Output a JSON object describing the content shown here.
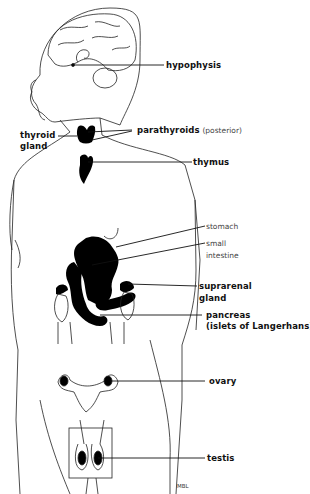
{
  "diagram": {
    "signature": "MBL",
    "labels": {
      "hypophysis": "hypophysis",
      "thyroid_line1": "thyroid",
      "thyroid_line2": "gland",
      "parathyroids": "parathyroids",
      "parathyroids_note": "(posterior)",
      "thymus": "thymus",
      "stomach": "stomach",
      "small_intestine_line1": "small",
      "small_intestine_line2": "intestine",
      "suprarenal_line1": "suprarenal",
      "suprarenal_line2": "gland",
      "pancreas_line1": "pancreas",
      "pancreas_line2": "(islets of Langerhans)",
      "ovary": "ovary",
      "testis": "testis"
    },
    "colors": {
      "line": "#222222",
      "organ_fill": "#000000",
      "background": "#ffffff"
    }
  }
}
